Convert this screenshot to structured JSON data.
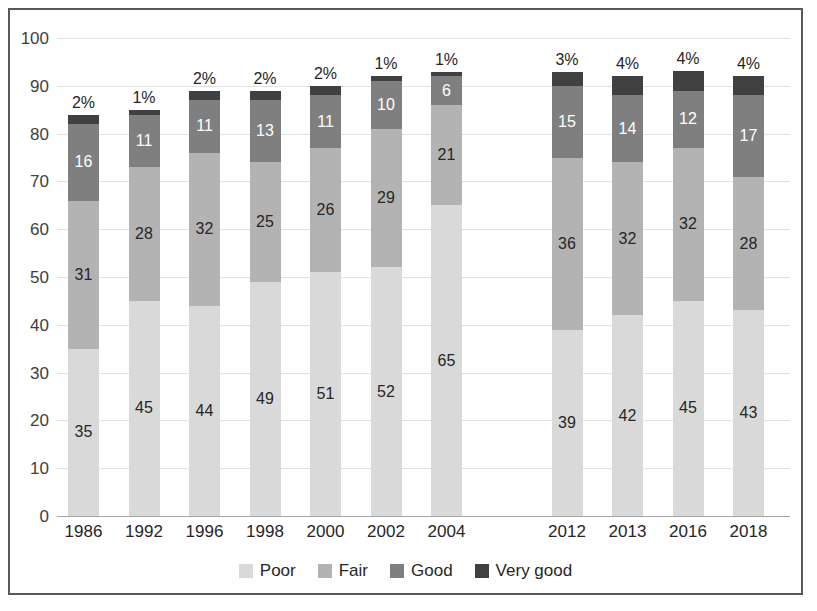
{
  "chart_data": {
    "type": "bar",
    "subtype": "stacked-bar",
    "title": "",
    "xlabel": "",
    "ylabel": "",
    "ylim": [
      0,
      100
    ],
    "ytick_labels": [
      "100",
      "90",
      "80",
      "70",
      "60",
      "50",
      "40",
      "30",
      "20",
      "10",
      "0"
    ],
    "ytick_values": [
      100,
      90,
      80,
      70,
      60,
      50,
      40,
      30,
      20,
      10,
      0
    ],
    "grid": true,
    "legend_position": "bottom",
    "categories": [
      "1986",
      "1992",
      "1996",
      "1998",
      "2000",
      "2002",
      "2004",
      "2012",
      "2013",
      "2016",
      "2018"
    ],
    "series": [
      {
        "name": "Poor",
        "color": "#d9d9d9",
        "values": [
          35,
          45,
          44,
          49,
          51,
          52,
          65,
          39,
          42,
          45,
          43
        ]
      },
      {
        "name": "Fair",
        "color": "#b3b3b3",
        "values": [
          31,
          28,
          32,
          25,
          26,
          29,
          21,
          36,
          32,
          32,
          28
        ]
      },
      {
        "name": "Good",
        "color": "#7f7f7f",
        "values": [
          16,
          11,
          11,
          13,
          11,
          10,
          6,
          15,
          14,
          12,
          17
        ]
      },
      {
        "name": "Very good",
        "color": "#404040",
        "values": [
          2,
          1,
          2,
          2,
          2,
          1,
          1,
          3,
          4,
          4,
          4
        ]
      }
    ],
    "top_labels": [
      "2%",
      "1%",
      "2%",
      "2%",
      "2%",
      "1%",
      "1%",
      "3%",
      "4%",
      "4%",
      "4%"
    ],
    "segment_labels": [
      [
        "35",
        "31",
        "16",
        ""
      ],
      [
        "45",
        "28",
        "11",
        ""
      ],
      [
        "44",
        "32",
        "11",
        ""
      ],
      [
        "49",
        "25",
        "13",
        ""
      ],
      [
        "51",
        "26",
        "11",
        ""
      ],
      [
        "52",
        "29",
        "10",
        ""
      ],
      [
        "65",
        "21",
        "6",
        ""
      ],
      [
        "39",
        "36",
        "15",
        ""
      ],
      [
        "42",
        "32",
        "14",
        ""
      ],
      [
        "45",
        "32",
        "12",
        ""
      ],
      [
        "43",
        "28",
        "17",
        ""
      ]
    ],
    "category_gap_after": "2004"
  },
  "legend": {
    "items": [
      {
        "label": "Poor",
        "color": "#d9d9d9"
      },
      {
        "label": "Fair",
        "color": "#b3b3b3"
      },
      {
        "label": "Good",
        "color": "#7f7f7f"
      },
      {
        "label": "Very good",
        "color": "#404040"
      }
    ]
  }
}
